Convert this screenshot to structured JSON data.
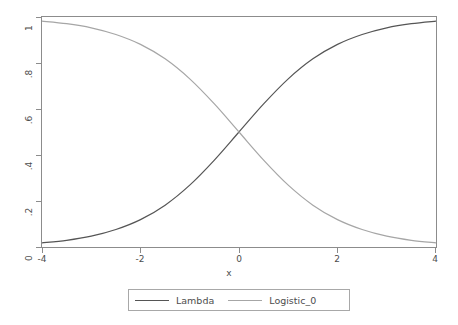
{
  "chart_data": {
    "type": "line",
    "title": "",
    "subtitle": "",
    "xlabel": "x",
    "ylabel": "",
    "xlim": [
      -4,
      4
    ],
    "ylim": [
      0,
      1
    ],
    "grid": false,
    "legend_position": "bottom",
    "x_ticks": [
      "-4",
      "-2",
      "0",
      "2",
      "4"
    ],
    "x_tick_values": [
      -4,
      -2,
      0,
      2,
      4
    ],
    "y_ticks": [
      "0",
      ".2",
      ".4",
      ".6",
      ".8",
      "1"
    ],
    "y_tick_values": [
      0,
      0.2,
      0.4,
      0.6,
      0.8,
      1
    ],
    "x": [
      -4,
      -3.5,
      -3,
      -2.5,
      -2,
      -1.5,
      -1,
      -0.5,
      0,
      0.5,
      1,
      1.5,
      2,
      2.5,
      3,
      3.5,
      4
    ],
    "series": [
      {
        "name": "Lambda",
        "color": "#555555",
        "values": [
          0.018,
          0.029,
          0.047,
          0.076,
          0.119,
          0.182,
          0.269,
          0.378,
          0.5,
          0.622,
          0.731,
          0.818,
          0.881,
          0.924,
          0.953,
          0.971,
          0.982
        ]
      },
      {
        "name": "Logistic_0",
        "color": "#a6a6a6",
        "values": [
          0.982,
          0.971,
          0.953,
          0.924,
          0.881,
          0.818,
          0.731,
          0.622,
          0.5,
          0.378,
          0.269,
          0.182,
          0.119,
          0.076,
          0.047,
          0.029,
          0.018
        ]
      }
    ],
    "legend": [
      {
        "label": "Lambda",
        "color": "#555555"
      },
      {
        "label": "Logistic_0",
        "color": "#a6a6a6"
      }
    ],
    "colors": {
      "background": "#ffffff",
      "frame": "#8c8c8c",
      "text": "#4d4d4d",
      "legend_border": "#a8a8a8",
      "series_1": "#555555",
      "series_2": "#a6a6a6"
    }
  }
}
